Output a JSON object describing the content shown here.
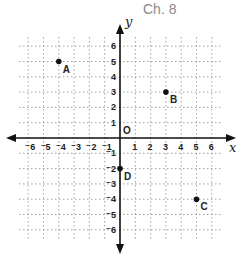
{
  "header": {
    "title": "Ch. 8"
  },
  "graph": {
    "x_axis_label": "x",
    "y_axis_label": "y",
    "origin_label": "O",
    "x_range": [
      -6,
      6
    ],
    "y_range": [
      -6,
      6
    ],
    "x_tick_labels": [
      "⁻6",
      "⁻5",
      "⁻4",
      "⁻3",
      "⁻2",
      "⁻1",
      "1",
      "2",
      "3",
      "4",
      "5",
      "6"
    ],
    "y_tick_labels": [
      "6",
      "5",
      "4",
      "3",
      "2",
      "1",
      "⁻1",
      "⁻2",
      "⁻3",
      "⁻4",
      "⁻5",
      "⁻6"
    ],
    "points": [
      {
        "label": "A",
        "x": -4,
        "y": 5
      },
      {
        "label": "B",
        "x": 3,
        "y": 3
      },
      {
        "label": "C",
        "x": 5,
        "y": -4
      },
      {
        "label": "D",
        "x": 0,
        "y": -2
      }
    ]
  }
}
